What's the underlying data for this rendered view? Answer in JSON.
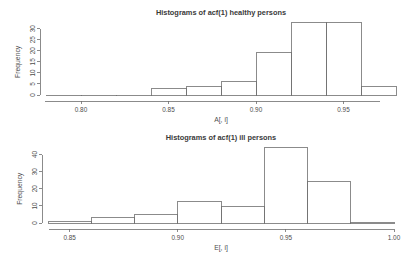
{
  "chart_data": [
    {
      "id": "healthy",
      "type": "bar",
      "title": "Histograms of acf(1) healthy persons",
      "xlabel": "A[, i]",
      "ylabel": "Frequency",
      "grid": false,
      "legend": "none",
      "xlim": [
        0.78,
        0.98
      ],
      "ylim": [
        0,
        33
      ],
      "xticks": [
        0.8,
        0.85,
        0.9,
        0.95
      ],
      "xtick_labels": [
        "0.80",
        "0.85",
        "0.90",
        "0.95"
      ],
      "yticks": [
        0,
        5,
        10,
        15,
        20,
        25,
        30
      ],
      "ytick_labels": [
        "0",
        "5",
        "10",
        "15",
        "20",
        "25",
        "30"
      ],
      "bin_width": 0.02,
      "bins": [
        {
          "x0": 0.78,
          "x1": 0.8,
          "value": 0
        },
        {
          "x0": 0.8,
          "x1": 0.82,
          "value": 0
        },
        {
          "x0": 0.82,
          "x1": 0.84,
          "value": 0
        },
        {
          "x0": 0.84,
          "x1": 0.86,
          "value": 3
        },
        {
          "x0": 0.86,
          "x1": 0.88,
          "value": 4
        },
        {
          "x0": 0.88,
          "x1": 0.9,
          "value": 6
        },
        {
          "x0": 0.9,
          "x1": 0.92,
          "value": 19
        },
        {
          "x0": 0.92,
          "x1": 0.94,
          "value": 33
        },
        {
          "x0": 0.94,
          "x1": 0.96,
          "value": 33
        },
        {
          "x0": 0.96,
          "x1": 0.98,
          "value": 4
        }
      ]
    },
    {
      "id": "ill",
      "type": "bar",
      "title": "Histograms of acf(1) ill persons",
      "xlabel": "E[, i]",
      "ylabel": "Frequency",
      "grid": false,
      "legend": "none",
      "xlim": [
        0.84,
        1.0
      ],
      "ylim": [
        0,
        45
      ],
      "xticks": [
        0.85,
        0.9,
        0.95,
        1.0
      ],
      "xtick_labels": [
        "0.85",
        "0.90",
        "0.95",
        "1.00"
      ],
      "yticks": [
        0,
        10,
        20,
        30,
        40
      ],
      "ytick_labels": [
        "0",
        "10",
        "20",
        "30",
        "40"
      ],
      "bin_width": 0.02,
      "bins": [
        {
          "x0": 0.84,
          "x1": 0.86,
          "value": 1
        },
        {
          "x0": 0.86,
          "x1": 0.88,
          "value": 3
        },
        {
          "x0": 0.88,
          "x1": 0.9,
          "value": 5
        },
        {
          "x0": 0.9,
          "x1": 0.92,
          "value": 12.5
        },
        {
          "x0": 0.92,
          "x1": 0.94,
          "value": 9.5
        },
        {
          "x0": 0.94,
          "x1": 0.96,
          "value": 44
        },
        {
          "x0": 0.96,
          "x1": 0.98,
          "value": 24
        },
        {
          "x0": 0.98,
          "x1": 1.0,
          "value": 0.5
        }
      ]
    }
  ],
  "colors": {
    "background": "#ffffff",
    "axis": "#6e6e6e",
    "bar_stroke": "#6e6e6e",
    "text": "#4d4d4d",
    "title": "#3a3a3a"
  }
}
